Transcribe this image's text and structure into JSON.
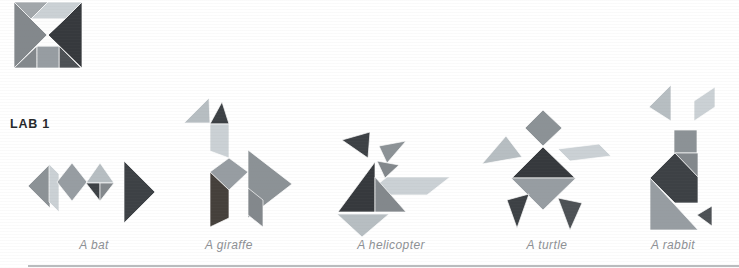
{
  "page": {
    "heading": "LAB 1",
    "background": "#ffffff"
  },
  "palette": {
    "darkest": "#36393d",
    "dark": "#3d4145",
    "dark_soft": "#4d5155",
    "dark_warm": "#45403b",
    "mid": "#8c9296",
    "mid_deep": "#979da2",
    "mid_dark": "#83888c",
    "light": "#b7bec2",
    "lighter": "#cbd1d5",
    "pale": "#a2a7ab",
    "white_piece": "#fdfdfd",
    "rule": "#8a8f93",
    "caption_color": "#8d9094",
    "heading_color": "#26282a"
  },
  "tangram_square": {
    "name": "tangram square model"
  },
  "figures": [
    {
      "id": "bat",
      "caption": "A bat"
    },
    {
      "id": "giraffe",
      "caption": "A giraffe"
    },
    {
      "id": "helicopter",
      "caption": "A helicopter"
    },
    {
      "id": "turtle",
      "caption": "A turtle"
    },
    {
      "id": "rabbit",
      "caption": "A rabbit"
    }
  ]
}
